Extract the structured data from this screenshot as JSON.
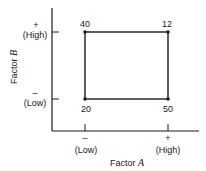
{
  "diagram": {
    "x_axis": {
      "label": "Factor ",
      "label_var": "A",
      "low_sign": "–",
      "low_label": "(Low)",
      "high_sign": "+",
      "high_label": "(High)"
    },
    "y_axis": {
      "label": "Factor ",
      "label_var": "B",
      "low_sign": "–",
      "low_label": "(Low)",
      "high_sign": "+",
      "high_label": "(High)"
    },
    "corners": {
      "low_a_high_b": "40",
      "high_a_high_b": "12",
      "low_a_low_b": "20",
      "high_a_low_b": "50"
    }
  }
}
